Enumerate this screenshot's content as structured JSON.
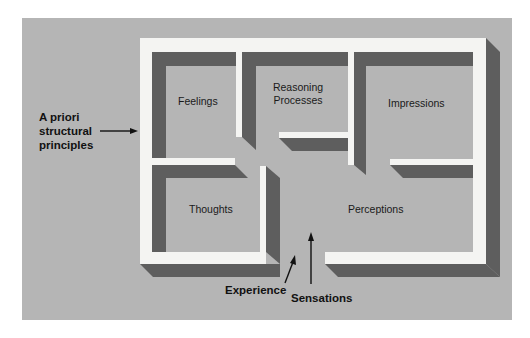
{
  "diagram": {
    "colors": {
      "background": "#b5b5b5",
      "wall": "#f4f4f2",
      "shadow": "#5e5e5e",
      "text": "#1a1a1a"
    },
    "rooms": [
      {
        "id": "feelings",
        "label": "Feelings"
      },
      {
        "id": "reasoning",
        "label_line1": "Reasoning",
        "label_line2": "Processes"
      },
      {
        "id": "impressions",
        "label": "Impressions"
      },
      {
        "id": "thoughts",
        "label": "Thoughts"
      },
      {
        "id": "perceptions",
        "label": "Perceptions"
      }
    ],
    "annotations": {
      "a_priori": {
        "line1": "A priori",
        "line2": "structural",
        "line3": "principles"
      },
      "experience": "Experience",
      "sensations": "Sensations"
    }
  }
}
